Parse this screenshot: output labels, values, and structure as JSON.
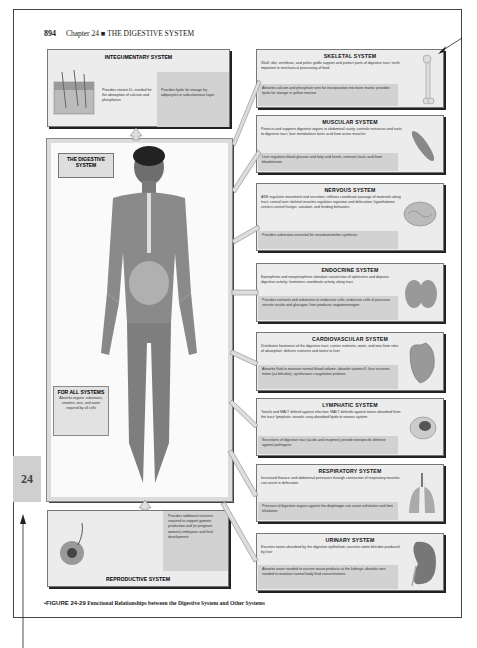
{
  "header": {
    "page_number": "894",
    "chapter": "Chapter 24 ■ THE DIGESTIVE SYSTEM"
  },
  "chapter_tab": "24",
  "central": {
    "label": "THE DIGESTIVE SYSTEM",
    "for_all": {
      "title": "FOR ALL SYSTEMS",
      "text": "Absorbs organic substrates, vitamins, ions, and water required by all cells"
    }
  },
  "integumentary": {
    "title": "INTEGUMENTARY SYSTEM",
    "text1": "Provides vitamin D₃ needed for the absorption of calcium and phosphorus",
    "text2": "Provides lipids for storage by adipocytes in subcutaneous layer"
  },
  "reproductive": {
    "title": "REPRODUCTIVE SYSTEM",
    "text": "Provides additional nutrients required to support gamete production and (in pregnant women) embryonic and fetal development"
  },
  "systems": [
    {
      "title": "SKELETAL SYSTEM",
      "text1": "Skull, ribs, vertebrae, and pelvic girdle support and protect parts of digestive tract; teeth important in mechanical processing of food",
      "text2": "Absorbs calcium and phosphate ions for incorporation into bone matrix; provides lipids for storage in yellow marrow",
      "icon": "bone-icon"
    },
    {
      "title": "MUSCULAR SYSTEM",
      "text1": "Protects and supports digestive organs in abdominal cavity; controls entrances and exits to digestive tract; liver metabolizes lactic acid from active muscles",
      "text2": "Liver regulates blood glucose and fatty acid levels, removes lactic acid from bloodstream",
      "icon": "muscle-icon"
    },
    {
      "title": "NERVOUS SYSTEM",
      "text1": "ANS regulates movement and secretion; reflexes coordinate passage of materials along tract; control over skeletal muscles regulates ingestion and defecation; hypothalamic centers control hunger, satiation, and feeding behaviors",
      "text2": "Provides substrates essential for neurotransmitter synthesis",
      "icon": "brain-icon"
    },
    {
      "title": "ENDOCRINE SYSTEM",
      "text1": "Epinephrine and norepinephrine stimulate constriction of sphincters and depress digestive activity; hormones coordinate activity along tract",
      "text2": "Provides nutrients and substrates to endocrine cells; endocrine cells of pancreas secrete insulin and glucagon; liver produces angiotensinogen",
      "icon": "thyroid-icon"
    },
    {
      "title": "CARDIOVASCULAR SYSTEM",
      "text1": "Distributes hormones of the digestive tract; carries nutrients, water, and ions from sites of absorption; delivers nutrients and toxins to liver",
      "text2": "Absorbs fluid to maintain normal blood volume; absorbs vitamin K; liver excretes heme (as bilirubin), synthesizes coagulation proteins",
      "icon": "heart-icon"
    },
    {
      "title": "LYMPHATIC SYSTEM",
      "text1": "Tonsils and MALT defend against infection; MALT defends against toxins absorbed from the tract; lymphatic vessels carry absorbed lipids to venous system",
      "text2": "Secretions of digestive tract (acids and enzymes) provide nonspecific defense against pathogens",
      "icon": "lymph-node-icon"
    },
    {
      "title": "RESPIRATORY SYSTEM",
      "text1": "Increased thoracic and abdominal pressures through contraction of respiratory muscles can assist in defecation",
      "text2": "Pressure of digestive organs against the diaphragm can assist exhalation and limit inhalation",
      "icon": "lungs-icon"
    },
    {
      "title": "URINARY SYSTEM",
      "text1": "Excretes toxins absorbed by the digestive epithelium; excretes some bilirubin produced by liver",
      "text2": "Absorbs water needed to excrete waste products at the kidneys; absorbs ions needed to maintain normal body fluid concentrations",
      "icon": "kidney-icon"
    }
  ],
  "caption": {
    "figure": "•FIGURE 24-29",
    "text": "Functional Relationships between the Digestive System and Other Systems"
  }
}
